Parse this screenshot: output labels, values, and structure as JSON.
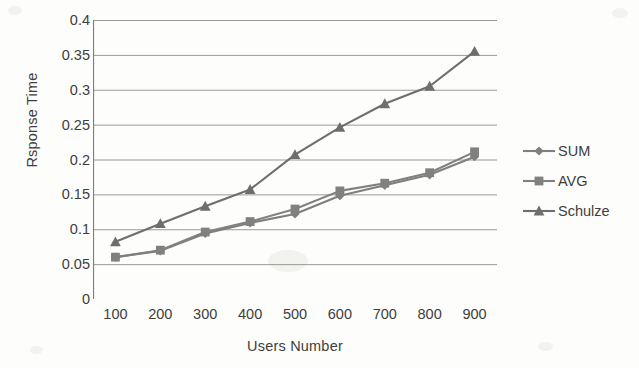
{
  "chart_data": {
    "type": "line",
    "title": "",
    "xlabel": "Users Number",
    "ylabel": "Rsponse Time",
    "categories": [
      100,
      200,
      300,
      400,
      500,
      600,
      700,
      800,
      900
    ],
    "xtick_labels": [
      "100",
      "200",
      "300",
      "400",
      "500",
      "600",
      "700",
      "800",
      "900"
    ],
    "ytick_labels": [
      "0",
      "0.05",
      "0.1",
      "0.15",
      "0.2",
      "0.25",
      "0.3",
      "0.35",
      "0.4"
    ],
    "ytick_values": [
      0,
      0.05,
      0.1,
      0.15,
      0.2,
      0.25,
      0.3,
      0.35,
      0.4
    ],
    "ylim": [
      0,
      0.4
    ],
    "grid": "horizontal",
    "legend_position": "right",
    "series": [
      {
        "name": "SUM",
        "marker": "diamond",
        "color": "#7f7f7f",
        "values": [
          0.06,
          0.069,
          0.094,
          0.109,
          0.122,
          0.148,
          0.163,
          0.178,
          0.204
        ]
      },
      {
        "name": "AVG",
        "marker": "square",
        "color": "#808080",
        "values": [
          0.06,
          0.07,
          0.096,
          0.111,
          0.129,
          0.155,
          0.166,
          0.181,
          0.211
        ]
      },
      {
        "name": "Schulze",
        "marker": "triangle",
        "color": "#6e6e6e",
        "values": [
          0.082,
          0.108,
          0.133,
          0.157,
          0.207,
          0.246,
          0.28,
          0.305,
          0.355
        ]
      }
    ]
  },
  "axes": {
    "y_axis_title": "Rsponse Time",
    "x_axis_title": "Users Number"
  },
  "legend": {
    "items": [
      {
        "label": "SUM"
      },
      {
        "label": "AVG"
      },
      {
        "label": "Schulze"
      }
    ]
  }
}
